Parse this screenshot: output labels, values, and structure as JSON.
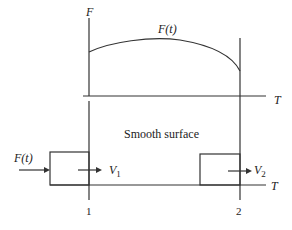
{
  "diagram": {
    "top_plot": {
      "y_axis_label": "F",
      "x_axis_label": "T",
      "curve_label": "F(t)"
    },
    "bottom_scene": {
      "surface_label": "Smooth surface",
      "axis_label": "T",
      "force_label": "F(t)",
      "velocity_1": {
        "symbol": "V",
        "sub": "1"
      },
      "velocity_2": {
        "symbol": "V",
        "sub": "2"
      },
      "position_1": "1",
      "position_2": "2"
    },
    "colors": {
      "line": "#333333",
      "text": "#222222",
      "background": "#ffffff"
    }
  }
}
